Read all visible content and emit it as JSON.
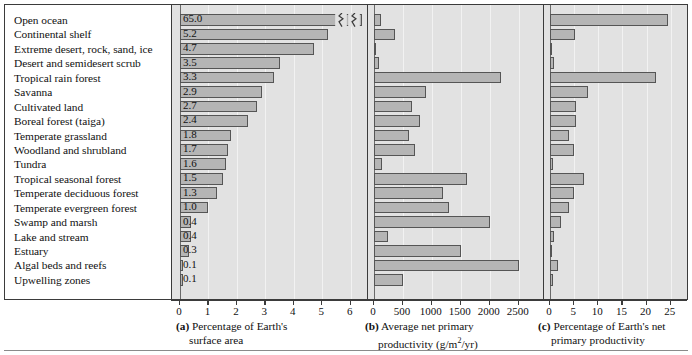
{
  "chart_data": {
    "type": "bar",
    "title": "",
    "orientation": "horizontal",
    "grid": true,
    "legend": false,
    "categories": [
      "Open ocean",
      "Continental shelf",
      "Extreme desert, rock, sand, ice",
      "Desert and semidesert scrub",
      "Tropical rain forest",
      "Savanna",
      "Cultivated land",
      "Boreal forest (taiga)",
      "Temperate grassland",
      "Woodland and shrubland",
      "Tundra",
      "Tropical seasonal forest",
      "Temperate deciduous forest",
      "Temperate evergreen forest",
      "Swamp and marsh",
      "Lake and stream",
      "Estuary",
      "Algal beds and reefs",
      "Upwelling zones"
    ],
    "panels": [
      {
        "key": "a",
        "letter": "(a)",
        "caption_line1": "Percentage of Earth's",
        "caption_line2": "surface area",
        "xlabel": "Percentage of Earth's surface area",
        "ticks": [
          0,
          1,
          2,
          3,
          4,
          5,
          6
        ],
        "tick_labels": [
          "0",
          "1",
          "2",
          "3",
          "4",
          "5",
          "6"
        ],
        "xlim": [
          0,
          6.4
        ],
        "axis_break": true,
        "values": [
          65.0,
          5.2,
          4.7,
          3.5,
          3.3,
          2.9,
          2.7,
          2.4,
          1.8,
          1.7,
          1.6,
          1.5,
          1.3,
          1.0,
          0.4,
          0.4,
          0.3,
          0.1,
          0.1
        ],
        "value_labels": [
          "65.0",
          "5.2",
          "4.7",
          "3.5",
          "3.3",
          "2.9",
          "2.7",
          "2.4",
          "1.8",
          "1.7",
          "1.6",
          "1.5",
          "1.3",
          "1.0",
          "0.4",
          "0.4",
          "0.3",
          "0.1",
          "0.1"
        ]
      },
      {
        "key": "b",
        "letter": "(b)",
        "caption_line1": "Average net primary",
        "caption_line2": "productivity (g/m2/yr)",
        "xlabel": "Average net primary productivity (g/m2/yr)",
        "ticks": [
          0,
          500,
          1000,
          1500,
          2000,
          2500
        ],
        "tick_labels": [
          "0",
          "500",
          "1000",
          "1500",
          "2000",
          "2500"
        ],
        "xlim": [
          0,
          2800
        ],
        "axis_break": false,
        "values": [
          125,
          360,
          3,
          90,
          2200,
          900,
          650,
          800,
          600,
          700,
          140,
          1600,
          1200,
          1300,
          2000,
          250,
          1500,
          2500,
          500
        ],
        "value_labels": []
      },
      {
        "key": "c",
        "letter": "(c)",
        "caption_line1": "Percentage of Earth's net",
        "caption_line2": "primary productivity",
        "xlabel": "Percentage of Earth's net primary productivity",
        "ticks": [
          0,
          5,
          10,
          15,
          20,
          25
        ],
        "tick_labels": [
          "0",
          "5",
          "10",
          "15",
          "20",
          "25"
        ],
        "xlim": [
          0,
          26.5
        ],
        "axis_break": false,
        "values": [
          24.4,
          5.2,
          0.1,
          0.9,
          22.0,
          7.9,
          5.4,
          5.4,
          4.0,
          4.9,
          0.6,
          7.1,
          4.9,
          4.0,
          2.3,
          0.9,
          0.4,
          1.6,
          0.6
        ],
        "value_labels": []
      }
    ]
  },
  "colors": {
    "bar_fill": "#b5b5b5",
    "bar_border": "#555555",
    "panel_background": "#e2e2e2",
    "label_background": "#ffffff",
    "frame": "#3b3b3b",
    "gridline": "#f2f2f2",
    "text": "#111111"
  }
}
